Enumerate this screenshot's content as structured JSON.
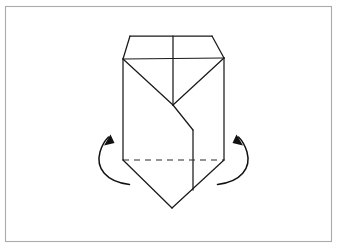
{
  "figure": {
    "canvas": {
      "width": 344,
      "height": 251
    },
    "colors": {
      "background": "#ffffff",
      "frame_stroke": "#aaaaaa",
      "line_stroke": "#1a1a1a",
      "dashed_stroke": "#2a2a2a",
      "arrow_stroke": "#111111"
    },
    "strokes": {
      "frame_width": 1.1,
      "line_width": 1.25,
      "dashed_width": 1.2,
      "arrow_width": 1.5,
      "dash_pattern": "6 5"
    }
  },
  "frame": {
    "label": "illustration-border",
    "x": 5.5,
    "y": 6.5,
    "width": 326,
    "height": 235
  },
  "shape": {
    "label": "folded-paper-model",
    "top_edge": {
      "label": "top-edge",
      "points": "130,36 212,36"
    },
    "left_top_bevel": {
      "label": "top-left-bevel",
      "points": "130,36 123,59"
    },
    "right_top_bevel": {
      "label": "top-right-bevel",
      "points": "212,36 224,58"
    },
    "shoulder_line": {
      "label": "horizontal-crease",
      "points": "123,59 224,58"
    },
    "center_vertical_top": {
      "label": "center-vertical-crease",
      "points": "173,36 173,105"
    },
    "diagonal_left": {
      "label": "left-diagonal-crease",
      "points": "123,59 173,105"
    },
    "diagonal_right": {
      "label": "right-diagonal-crease",
      "points": "224,58 173,105"
    },
    "diagonal_lower": {
      "label": "lower-diagonal-edge",
      "points": "173,105 193,130"
    },
    "inner_vertical": {
      "label": "inner-vertical-edge",
      "points": "193,130 193,190"
    },
    "left_side": {
      "label": "left-side-edge",
      "points": "123,59 123,160"
    },
    "right_side": {
      "label": "right-side-edge",
      "points": "224,58 224,160"
    },
    "dashed_crease": {
      "label": "horizontal-fold-line-dashed",
      "points": "123,160 224,160"
    },
    "bottom_left_edge": {
      "label": "bottom-left-edge",
      "points": "123,160 172,208"
    },
    "bottom_right_edge": {
      "label": "bottom-right-edge",
      "points": "172,208 224,160"
    }
  },
  "arrows": [
    {
      "label": "left-fold-arrow",
      "name": "fold-arrow-left",
      "direction": "up-right",
      "curve": "M 129.5,184.5 C 106,182 95.5,168 100,152 C 102,145 105,140.5 108.5,137",
      "head": "110.5,134.5 104.0,145.5 114.5,143.0"
    },
    {
      "label": "right-fold-arrow",
      "name": "fold-arrow-right",
      "direction": "up-left",
      "curve": "M 217.5,184.5 C 241,182 251.5,168 247,152 C 245,145 242,140.5 238.5,137",
      "head": "236.5,134.5 243.0,145.5 232.5,143.0"
    }
  ]
}
